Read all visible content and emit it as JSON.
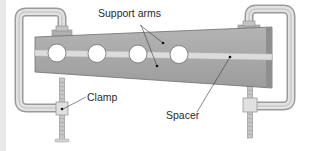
{
  "diagram": {
    "type": "apparatus-illustration",
    "labels": {
      "support_arms": "Support arms",
      "clamp": "Clamp",
      "spacer": "Spacer"
    },
    "components": [
      {
        "name": "Support arms",
        "count": 2,
        "description": "Upper and lower tapered bars with holes"
      },
      {
        "name": "Spacer",
        "description": "Light strip between the support arms"
      },
      {
        "name": "Clamp",
        "count": 2,
        "description": "C-clamps at left and right ends"
      }
    ],
    "holes": 4,
    "colors": {
      "bar": "#a9a9a9",
      "bar_dark": "#8c8c8c",
      "spacer": "#d9d9d9",
      "clamp": "#d6d6d6",
      "clamp_outline": "#9a9a9a",
      "text": "#2a2a2a",
      "edge_strip": "#e8e8e8"
    }
  }
}
